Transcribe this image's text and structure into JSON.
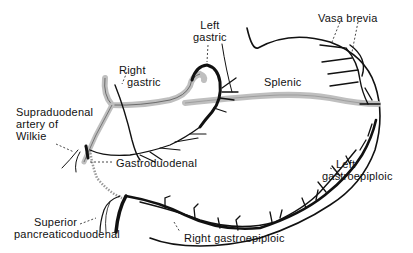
{
  "diagram": {
    "labels": {
      "left_gastric": [
        "Left",
        "gastric"
      ],
      "right_gastric": [
        "Right",
        "gastric"
      ],
      "vasa_brevia": "Vasa brevia",
      "splenic": "Splenic",
      "supraduodenal": [
        "Supraduodenal",
        "artery of",
        "Wilkie"
      ],
      "gastroduodenal": "Gastroduodenal",
      "left_gastroepiploic": [
        "Left",
        "gastroepiploic"
      ],
      "superior_pancreaticoduodenal": [
        "Superior",
        "pancreaticoduodenal"
      ],
      "right_gastroepiploic": "Right gastroepiploic"
    },
    "colors": {
      "vessel": "#111111",
      "shaded_vessel_fill": "#cfcfcf",
      "background": "#ffffff"
    }
  }
}
